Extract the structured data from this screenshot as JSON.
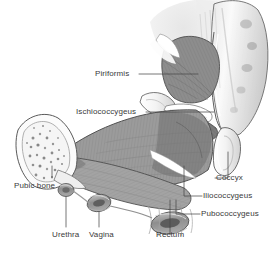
{
  "figure": {
    "background_color": "#ffffff",
    "label_color": "#3a3a3a",
    "leader_line_color": "#4a4a4a",
    "palette": {
      "muscle_mid": "#8f8f8f",
      "muscle_dark": "#6e6e6e",
      "muscle_light": "#b3b3b3",
      "bone_light": "#f2f2f2",
      "bone_shadow": "#cfcfcf",
      "outline": "#555555",
      "tendon": "#ffffff"
    }
  },
  "labels": [
    {
      "id": "piriformis",
      "text": "Piriformis",
      "x": 95,
      "y": 70,
      "align": "left"
    },
    {
      "id": "ischiococcygeus",
      "text": "Ischiococcygeus",
      "x": 76,
      "y": 108,
      "align": "left"
    },
    {
      "id": "pubic-bone",
      "text": "Pubic bone",
      "x": 14,
      "y": 182,
      "align": "left"
    },
    {
      "id": "urethra",
      "text": "Urethra",
      "x": 52,
      "y": 231,
      "align": "left"
    },
    {
      "id": "vagina",
      "text": "Vagina",
      "x": 89,
      "y": 231,
      "align": "left"
    },
    {
      "id": "rectum",
      "text": "Rectum",
      "x": 156,
      "y": 231,
      "align": "left"
    },
    {
      "id": "coccyx",
      "text": "Coccyx",
      "x": 216,
      "y": 183,
      "align": "left"
    },
    {
      "id": "iliococcygeus",
      "text": "Iliococcygeus",
      "x": 203,
      "y": 201,
      "align": "left"
    },
    {
      "id": "pubococcygeus",
      "text": "Pubococcygeus",
      "x": 201,
      "y": 219,
      "align": "left"
    }
  ],
  "structures": [
    {
      "id": "sacrum",
      "name": "sacrum-bone"
    },
    {
      "id": "coccyx-bone",
      "name": "coccyx-bone"
    },
    {
      "id": "piriformis-muscle",
      "name": "piriformis-muscle"
    },
    {
      "id": "ischiococcygeus-muscle",
      "name": "ischiococcygeus-muscle"
    },
    {
      "id": "iliococcygeus-muscle",
      "name": "iliococcygeus-muscle"
    },
    {
      "id": "pubococcygeus-muscle",
      "name": "pubococcygeus-muscle"
    },
    {
      "id": "pubic-bone-section",
      "name": "pubic-bone-cross-section"
    },
    {
      "id": "urethra-opening",
      "name": "urethra-canal"
    },
    {
      "id": "vagina-opening",
      "name": "vagina-canal"
    },
    {
      "id": "rectum-opening",
      "name": "rectum-canal"
    },
    {
      "id": "sacrospinous-ligament",
      "name": "sacrospinous-ligament"
    },
    {
      "id": "ischial-spine",
      "name": "ischial-spine"
    }
  ]
}
